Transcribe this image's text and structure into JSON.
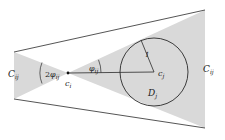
{
  "diagram": {
    "colors": {
      "fill": "#d9d9d9",
      "stroke": "#2a2a2a",
      "background": "#ffffff"
    },
    "labels": {
      "left_cone": {
        "main": "C",
        "sub": "ij"
      },
      "right_cone": {
        "main": "C",
        "sub": "ij"
      },
      "apex": {
        "main": "c",
        "sub": "i"
      },
      "center": {
        "main": "c",
        "sub": "j"
      },
      "disk": {
        "main": "D",
        "sub": "j"
      },
      "angle_double": {
        "prefix": "2",
        "main": "φ",
        "sub": "ij"
      },
      "angle_half": {
        "main": "φ",
        "sub": "ij"
      },
      "radius": "1"
    },
    "geometry": {
      "apex": [
        68,
        73
      ],
      "circle_center": [
        154,
        72
      ],
      "circle_radius": 34,
      "tangent_point": [
        141,
        40
      ]
    }
  }
}
